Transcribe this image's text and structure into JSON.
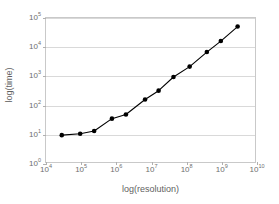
{
  "chart_data": {
    "type": "line",
    "title": "",
    "xlabel": "log(resolution)",
    "ylabel": "log(time)",
    "xscale": "log",
    "yscale": "log",
    "xlim": [
      10000,
      10000000000
    ],
    "ylim": [
      1,
      100000
    ],
    "grid": "horizontal",
    "legend": "none",
    "marker": "filled-circle",
    "line_color": "#000000",
    "marker_color": "#000000",
    "gridline_color": "#d9d9d9",
    "frame_color": "#c9c9c9",
    "background_color": "#ffffff",
    "x_tick_labels": [
      "10⁴",
      "10⁵",
      "10⁶",
      "10⁷",
      "10⁸",
      "10⁹",
      "10¹⁰"
    ],
    "x_tick_bases": [
      "10",
      "10",
      "10",
      "10",
      "10",
      "10",
      "10"
    ],
    "x_tick_exponents": [
      "4",
      "5",
      "6",
      "7",
      "8",
      "9",
      "10"
    ],
    "x_tick_values": [
      10000,
      100000,
      1000000,
      10000000,
      100000000,
      1000000000,
      10000000000
    ],
    "y_tick_labels": [
      "10⁰",
      "10¹",
      "10²",
      "10³",
      "10⁴",
      "10⁵"
    ],
    "y_tick_bases": [
      "10",
      "10",
      "10",
      "10",
      "10",
      "10"
    ],
    "y_tick_exponents": [
      "0",
      "1",
      "2",
      "3",
      "4",
      "5"
    ],
    "y_tick_values": [
      1,
      10,
      100,
      1000,
      10000,
      100000
    ],
    "series": [
      {
        "name": "runtime",
        "x": [
          30000,
          100000,
          250000,
          800000,
          2000000,
          7000000,
          17000000,
          45000000,
          130000000,
          400000000,
          1000000000,
          3000000000
        ],
        "y": [
          9,
          10,
          12.5,
          33,
          46,
          150,
          300,
          880,
          2000,
          6300,
          15000,
          47000
        ]
      }
    ]
  }
}
